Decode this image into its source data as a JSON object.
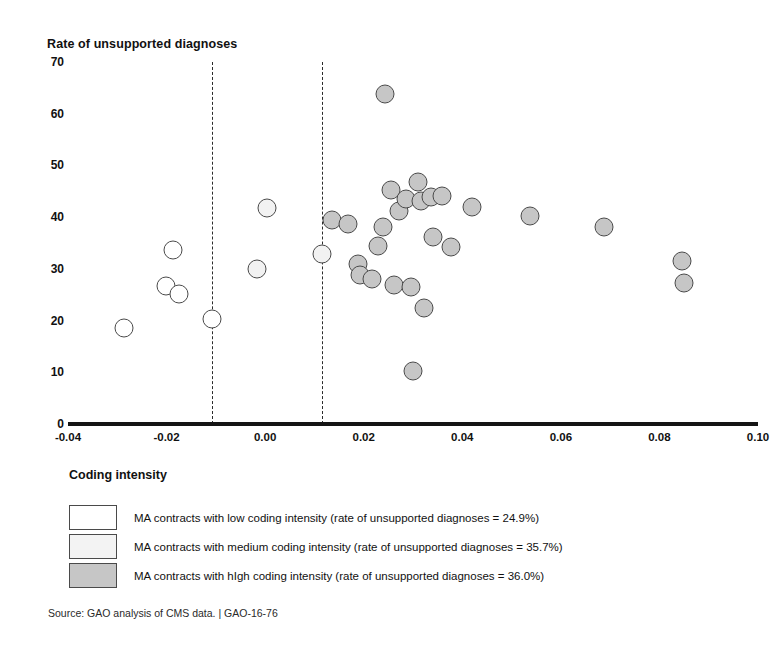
{
  "chart_data": {
    "type": "scatter",
    "title": "",
    "ylabel": "Rate of unsupported diagnoses",
    "xlabel": "Coding intensity",
    "xlim": [
      -0.04,
      0.1
    ],
    "ylim": [
      0,
      70
    ],
    "xticks": [
      "-0.04",
      "-0.02",
      "0.00",
      "0.02",
      "0.04",
      "0.06",
      "0.08",
      "0.10"
    ],
    "xtick_values": [
      -0.04,
      -0.02,
      0.0,
      0.02,
      0.04,
      0.06,
      0.08,
      0.1
    ],
    "yticks": [
      "0",
      "10",
      "20",
      "30",
      "40",
      "50",
      "60",
      "70"
    ],
    "ytick_values": [
      0,
      10,
      20,
      30,
      40,
      50,
      60,
      70
    ],
    "grid": false,
    "legend_position": "below-axes",
    "reference_lines": [
      {
        "name": "low-medium-boundary",
        "x": -0.0107,
        "style": "dashed"
      },
      {
        "name": "medium-high-boundary",
        "x": 0.0115,
        "style": "dashed"
      }
    ],
    "series": [
      {
        "name": "MA contracts with low coding intensity",
        "group": "low",
        "fill": "#ffffff",
        "mean_rate": 24.9,
        "points": [
          {
            "x": -0.0286,
            "y": 18.6
          },
          {
            "x": -0.0202,
            "y": 26.7
          },
          {
            "x": -0.0186,
            "y": 33.7
          },
          {
            "x": -0.0175,
            "y": 25.2
          },
          {
            "x": -0.0107,
            "y": 20.3
          }
        ]
      },
      {
        "name": "MA contracts with medium coding intensity",
        "group": "medium",
        "fill": "#f2f2f2",
        "mean_rate": 35.7,
        "points": [
          {
            "x": -0.0016,
            "y": 30.0
          },
          {
            "x": 0.0004,
            "y": 41.8
          },
          {
            "x": 0.0115,
            "y": 32.8
          }
        ]
      },
      {
        "name": "MA contracts with high coding intensity",
        "group": "high",
        "fill": "#c6c6c6",
        "mean_rate": 36.0,
        "points": [
          {
            "x": 0.0135,
            "y": 39.4
          },
          {
            "x": 0.0168,
            "y": 38.7
          },
          {
            "x": 0.0188,
            "y": 31.0
          },
          {
            "x": 0.0193,
            "y": 28.8
          },
          {
            "x": 0.0216,
            "y": 28.1
          },
          {
            "x": 0.0228,
            "y": 34.5
          },
          {
            "x": 0.0239,
            "y": 38.1
          },
          {
            "x": 0.0244,
            "y": 63.9
          },
          {
            "x": 0.0256,
            "y": 45.3
          },
          {
            "x": 0.0262,
            "y": 26.8
          },
          {
            "x": 0.0271,
            "y": 41.1
          },
          {
            "x": 0.0285,
            "y": 43.5
          },
          {
            "x": 0.0295,
            "y": 26.4
          },
          {
            "x": 0.03,
            "y": 10.2
          },
          {
            "x": 0.031,
            "y": 46.7
          },
          {
            "x": 0.0316,
            "y": 43.2
          },
          {
            "x": 0.0322,
            "y": 22.5
          },
          {
            "x": 0.0336,
            "y": 43.9
          },
          {
            "x": 0.034,
            "y": 36.2
          },
          {
            "x": 0.0358,
            "y": 44.0
          },
          {
            "x": 0.0377,
            "y": 34.3
          },
          {
            "x": 0.042,
            "y": 41.9
          },
          {
            "x": 0.0537,
            "y": 40.3
          },
          {
            "x": 0.0687,
            "y": 38.0
          },
          {
            "x": 0.0846,
            "y": 31.5
          },
          {
            "x": 0.0849,
            "y": 27.2
          }
        ]
      }
    ]
  },
  "axes": {
    "y_title": "Rate of unsupported diagnoses",
    "x_title": "Coding intensity"
  },
  "legend": {
    "title": "Coding intensity",
    "items": [
      {
        "swatch": "low",
        "label": "MA contracts with low coding intensity (rate of unsupported diagnoses = 24.9%)"
      },
      {
        "swatch": "medium",
        "label": "MA contracts with medium coding intensity (rate of unsupported diagnoses = 35.7%)"
      },
      {
        "swatch": "high",
        "label": "MA contracts with hIgh coding intensity (rate of unsupported diagnoses = 36.0%)"
      }
    ]
  },
  "footer": {
    "source": "Source: GAO analysis of CMS data.  |  GAO-16-76"
  },
  "colors": {
    "low_fill": "#ffffff",
    "medium_fill": "#f2f2f2",
    "high_fill": "#c6c6c6",
    "marker_stroke": "#4a4a4a",
    "axis": "#151515"
  }
}
